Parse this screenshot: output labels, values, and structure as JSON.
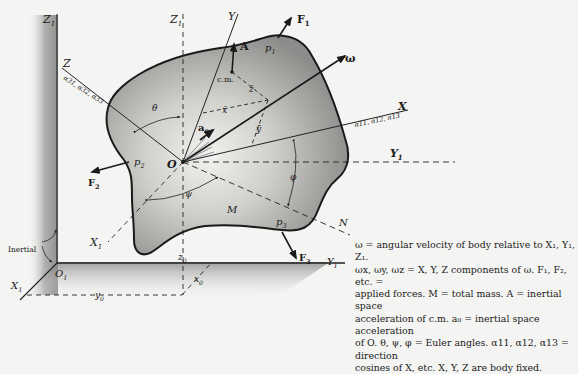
{
  "diagram": {
    "type": "rigid body dynamics schematic",
    "labels": {
      "Z1": "Z",
      "Z1_sub": "1",
      "Z1p": "Z",
      "Z1p_sub": "1",
      "Y": "Y",
      "F1": "F",
      "F1_sub": "1",
      "p1": "p",
      "p1_sub": "1",
      "A": "A",
      "cm": "c.m.",
      "omega": "ω",
      "Z": "Z",
      "a3": "α31, α32, α33",
      "theta": "θ",
      "zbar": "z̄",
      "xbar": "x̄",
      "ybar": "ȳ",
      "a0": "a",
      "a0_sub": "0",
      "X": "X",
      "a1": "α11, α12, α13",
      "Y1p": "Y",
      "Y1p_sub": "1",
      "p2": "p",
      "p2_sub": "2",
      "F2": "F",
      "F2_sub": "2",
      "O": "O",
      "phi": "φ",
      "psi": "ψ",
      "M": "M",
      "N": "N",
      "p3": "p",
      "p3_sub": "3",
      "F3": "F",
      "F3_sub": "3",
      "X1p": "X",
      "X1p_sub": "1",
      "inertial": "Inertial",
      "O1": "O",
      "O1_sub": "1",
      "X1": "X",
      "X1_sub": "1",
      "Y1": "Y",
      "Y1_sub": "1",
      "z0": "z",
      "z0_sub": "0",
      "x0": "x",
      "x0_sub": "0",
      "y0": "y",
      "y0_sub": "0"
    }
  },
  "caption": {
    "lines": [
      "ω = angular velocity of body relative to X₁, Y₁, Z₁.",
      "ωx, ωy, ωz = X, Y, Z components of ω. F₁, F₂, etc. =",
      "applied forces. M = total mass. A = inertial space",
      "acceleration of c.m. a₀ = inertial space acceleration",
      "of O. θ, ψ, φ = Euler angles. α11, α12, α13 = direction",
      "cosines of X, etc. X, Y, Z are body fixed."
    ]
  }
}
